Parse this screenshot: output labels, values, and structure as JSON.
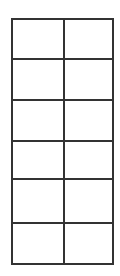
{
  "table": {
    "rows": 6,
    "columns": 2,
    "line_color": "#333333",
    "background": "#ffffff",
    "cells": [
      [
        "",
        ""
      ],
      [
        "",
        ""
      ],
      [
        "",
        ""
      ],
      [
        "",
        ""
      ],
      [
        "",
        ""
      ],
      [
        "",
        ""
      ]
    ]
  }
}
